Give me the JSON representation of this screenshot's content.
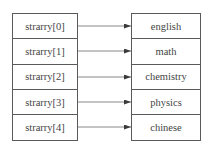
{
  "diagram": {
    "title": "",
    "pointers": [
      {
        "label": "strarry[0]"
      },
      {
        "label": "strarry[1]"
      },
      {
        "label": "strarry[2]"
      },
      {
        "label": "strarry[3]"
      },
      {
        "label": "strarry[4]"
      }
    ],
    "values": [
      {
        "label": "english"
      },
      {
        "label": "math"
      },
      {
        "label": "chemistry"
      },
      {
        "label": "physics"
      },
      {
        "label": "chinese"
      }
    ],
    "edges": [
      {
        "from": "strarry[0]",
        "to": "english"
      },
      {
        "from": "strarry[1]",
        "to": "math"
      },
      {
        "from": "strarry[2]",
        "to": "chemistry"
      },
      {
        "from": "strarry[3]",
        "to": "physics"
      },
      {
        "from": "strarry[4]",
        "to": "chinese"
      }
    ],
    "colors": {
      "line": "#5a5a5a",
      "text": "#444444",
      "background": "#ffffff"
    }
  }
}
